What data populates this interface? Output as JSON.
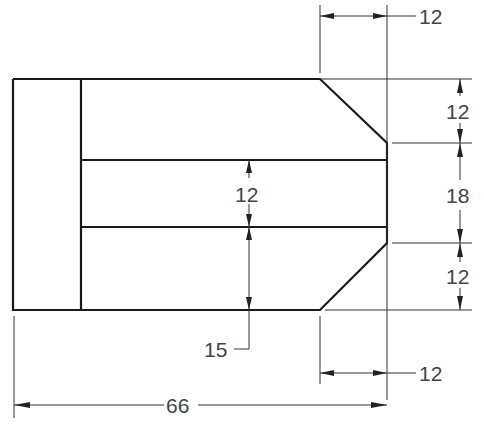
{
  "drawing": {
    "type": "technical-drawing",
    "units": "mm",
    "dimensions": {
      "top_chamfer_width": "12",
      "top_chamfer_height": "12",
      "right_flat_height": "18",
      "bottom_chamfer_height": "12",
      "bottom_chamfer_width": "12",
      "slot_height": "12",
      "slot_bottom_offset": "15",
      "overall_length": "66"
    }
  }
}
